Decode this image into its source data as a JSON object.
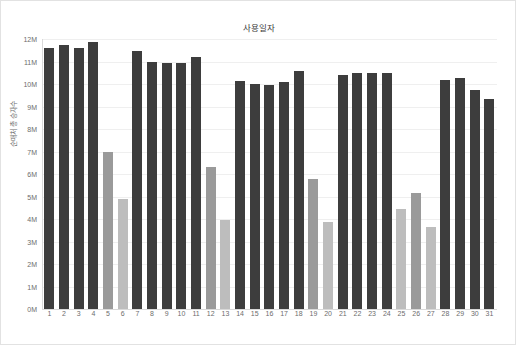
{
  "chart_data": {
    "type": "bar",
    "title": "사용일자",
    "xlabel": "",
    "ylabel": "순매처 총 승자수",
    "ylim": [
      0,
      12000000
    ],
    "ytick_labels": [
      "12M",
      "11M",
      "10M",
      "9M",
      "8M",
      "7M",
      "6M",
      "5M",
      "4M",
      "3M",
      "2M",
      "1M",
      "0M"
    ],
    "ytick_values": [
      12000000,
      11000000,
      10000000,
      9000000,
      8000000,
      7000000,
      6000000,
      5000000,
      4000000,
      3000000,
      2000000,
      1000000,
      0
    ],
    "grid": true,
    "legend": "none",
    "categories": [
      "1",
      "2",
      "3",
      "4",
      "5",
      "6",
      "7",
      "8",
      "9",
      "10",
      "11",
      "12",
      "13",
      "14",
      "15",
      "16",
      "17",
      "18",
      "19",
      "20",
      "21",
      "22",
      "23",
      "24",
      "25",
      "26",
      "27",
      "28",
      "29",
      "30",
      "31"
    ],
    "values": [
      11600000,
      11750000,
      11600000,
      11850000,
      7000000,
      4900000,
      11450000,
      11000000,
      10950000,
      10950000,
      11200000,
      6300000,
      3950000,
      10150000,
      10000000,
      9950000,
      10100000,
      10600000,
      5800000,
      3850000,
      10400000,
      10500000,
      10500000,
      10500000,
      4450000,
      5150000,
      3650000,
      10200000,
      10250000,
      9750000,
      9350000
    ],
    "bar_styles": [
      "dark",
      "dark",
      "dark",
      "dark",
      "mid",
      "light",
      "dark",
      "dark",
      "dark",
      "dark",
      "dark",
      "mid",
      "light",
      "dark",
      "dark",
      "dark",
      "dark",
      "dark",
      "mid",
      "light",
      "dark",
      "dark",
      "dark",
      "dark",
      "light",
      "mid",
      "light",
      "dark",
      "dark",
      "dark",
      "dark"
    ],
    "colors": {
      "dark": "#3d3d3d",
      "mid": "#9a9a9a",
      "light": "#bdbdbd",
      "grid": "#efefef",
      "axis": "#d9d9d9",
      "text": "#6d6d6d",
      "title": "#3b3b3b"
    }
  }
}
